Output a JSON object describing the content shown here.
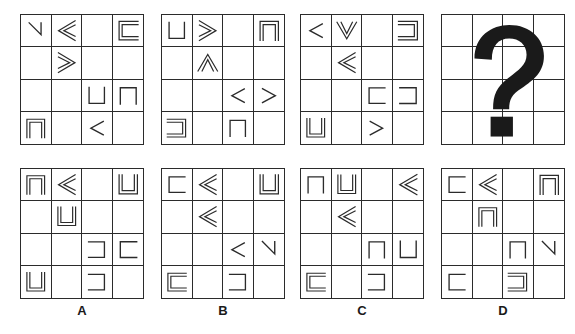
{
  "puzzle": {
    "type": "matrix-reasoning-4x4-shape-grid",
    "stroke_color": "#2b2b2b",
    "background_color": "#ffffff",
    "grid_rows": 4,
    "grid_cols": 4,
    "missing_panel_marker": "?",
    "question_mark_label": "?"
  },
  "shape_legend": {
    "chevron-sw": "single-stroke V chevron opening toward upper-right",
    "chevron-se": "single-stroke V chevron opening toward upper-left",
    "chevron-ne": "single-stroke V chevron opening toward lower-left",
    "chevron-nw": "single-stroke V chevron opening toward lower-right",
    "double-chevron-sw": "double-stroke nested chevron opening toward right",
    "double-chevron-se": "double-stroke nested chevron opening toward left",
    "double-chevron-ne": "double-stroke nested chevron opening toward lower-left",
    "double-chevron-nw": "double-stroke nested chevron opening toward lower-right",
    "bracket-up": "single-stroke bracket open at bottom",
    "bracket-down": "single-stroke bracket open at top",
    "bracket-left": "single-stroke bracket open at right",
    "bracket-right": "single-stroke bracket open at left",
    "double-bracket-up": "double-stroke bracket open at bottom",
    "double-bracket-down": "double-stroke bracket open at top",
    "double-bracket-left": "double-stroke bracket open at right",
    "double-bracket-right": "double-stroke bracket open at left",
    "empty": "blank cell"
  },
  "sequence": {
    "name": "problem-sequence",
    "panels": [
      {
        "name": "problem-panel-1",
        "index": 1,
        "cells": [
          "chevron-se",
          "double-chevron-ne",
          "empty",
          "double-bracket-left",
          "empty",
          "double-chevron-nw",
          "empty",
          "empty",
          "empty",
          "empty",
          "bracket-up",
          "bracket-down",
          "double-bracket-down",
          "empty",
          "chevron-ne",
          "empty"
        ]
      },
      {
        "name": "problem-panel-2",
        "index": 2,
        "cells": [
          "bracket-up",
          "double-chevron-nw",
          "empty",
          "double-bracket-down",
          "empty",
          "double-chevron-sw",
          "empty",
          "empty",
          "empty",
          "empty",
          "chevron-ne",
          "chevron-nw",
          "double-bracket-right",
          "empty",
          "bracket-down",
          "empty"
        ]
      },
      {
        "name": "problem-panel-3",
        "index": 3,
        "cells": [
          "chevron-ne",
          "double-chevron-se",
          "empty",
          "double-bracket-right",
          "empty",
          "double-chevron-ne",
          "empty",
          "empty",
          "empty",
          "empty",
          "bracket-left",
          "bracket-right",
          "double-bracket-up",
          "empty",
          "chevron-nw",
          "empty"
        ]
      },
      {
        "name": "problem-panel-4-missing",
        "index": 4,
        "cells": [
          "empty",
          "empty",
          "empty",
          "empty",
          "empty",
          "empty",
          "empty",
          "empty",
          "empty",
          "empty",
          "empty",
          "empty",
          "empty",
          "empty",
          "empty",
          "empty"
        ],
        "is_missing": true
      }
    ]
  },
  "options": [
    {
      "name": "option-a",
      "label": "A",
      "cells": [
        "double-bracket-down",
        "double-chevron-ne",
        "empty",
        "double-bracket-up",
        "empty",
        "double-bracket-up",
        "empty",
        "empty",
        "empty",
        "empty",
        "bracket-right",
        "bracket-left",
        "double-bracket-up",
        "empty",
        "bracket-right",
        "empty"
      ]
    },
    {
      "name": "option-b",
      "label": "B",
      "cells": [
        "bracket-left",
        "double-chevron-ne",
        "empty",
        "double-bracket-up",
        "empty",
        "double-chevron-ne",
        "empty",
        "empty",
        "empty",
        "empty",
        "chevron-ne",
        "chevron-se",
        "double-bracket-left",
        "empty",
        "bracket-right",
        "empty"
      ]
    },
    {
      "name": "option-c",
      "label": "C",
      "cells": [
        "bracket-down",
        "double-bracket-up",
        "empty",
        "double-chevron-ne",
        "empty",
        "double-chevron-ne",
        "empty",
        "empty",
        "empty",
        "empty",
        "bracket-down",
        "bracket-up",
        "double-bracket-left",
        "empty",
        "bracket-right",
        "empty"
      ]
    },
    {
      "name": "option-d",
      "label": "D",
      "cells": [
        "bracket-left",
        "double-chevron-ne",
        "empty",
        "double-bracket-down",
        "empty",
        "double-bracket-down",
        "empty",
        "empty",
        "empty",
        "empty",
        "bracket-down",
        "chevron-se",
        "bracket-left",
        "empty",
        "double-bracket-right",
        "empty"
      ]
    }
  ]
}
